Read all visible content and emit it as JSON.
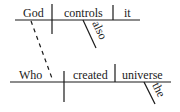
{
  "diagram": {
    "type": "sentence-diagram",
    "main_clause": {
      "subject": "God",
      "verb": "controls",
      "object": "it",
      "verb_modifier": "also"
    },
    "relative_clause": {
      "subject": "Who",
      "verb": "created",
      "object": "universe",
      "object_modifier": "the"
    },
    "connector": "dashed line from God to Who",
    "colors": {
      "ink": "#1a1a1a",
      "background": "#ffffff"
    }
  }
}
